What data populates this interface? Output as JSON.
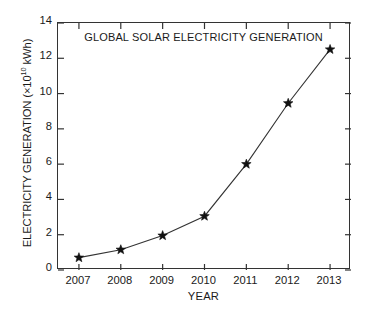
{
  "chart_data": {
    "type": "line",
    "title": "GLOBAL SOLAR ELECTRICITY GENERATION",
    "xlabel": "YEAR",
    "ylabel": "ELECTRICITY GENERATION (×10¹⁰ kWh)",
    "ylabel_prefix": "ELECTRICITY GENERATION (×10",
    "ylabel_exponent": "10",
    "ylabel_suffix": " kWh)",
    "categories": [
      "2007",
      "2008",
      "2009",
      "2010",
      "2011",
      "2012",
      "2013"
    ],
    "x": [
      2007,
      2008,
      2009,
      2010,
      2011,
      2012,
      2013
    ],
    "values": [
      0.7,
      1.15,
      1.95,
      3.05,
      6.0,
      9.45,
      12.5
    ],
    "xlim": [
      2006.5,
      2013.5
    ],
    "ylim": [
      0,
      14
    ],
    "yticks": [
      0,
      2,
      4,
      6,
      8,
      10,
      12,
      14
    ],
    "ytick_labels": [
      "0",
      "2",
      "4",
      "6",
      "8",
      "10",
      "12",
      "14"
    ],
    "xticks": [
      2007,
      2008,
      2009,
      2010,
      2011,
      2012,
      2013
    ],
    "xtick_labels": [
      "2007",
      "2008",
      "2009",
      "2010",
      "2011",
      "2012",
      "2013"
    ],
    "grid": false,
    "legend": null,
    "marker": "star",
    "line_color": "#333333",
    "marker_color": "#111111",
    "frame_color": "#333333",
    "background": "#ffffff",
    "tick_direction": "in",
    "frame": "box"
  }
}
